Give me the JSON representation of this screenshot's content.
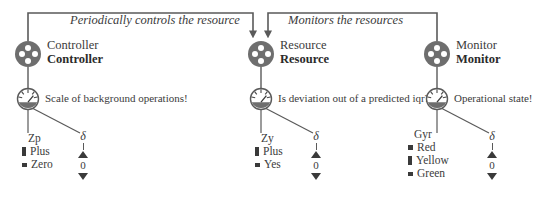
{
  "diagram": {
    "colors": {
      "node_fill": "#6e6e6e",
      "node_hole": "#ffffff",
      "wire": "#5a5a5a",
      "text": "#3b3b3b",
      "swatch": "#3a3a3a"
    }
  },
  "edges": [
    {
      "id": "controller-to-resource",
      "caption": "Periodically controls the resource",
      "from": "Controller",
      "to": "Resource"
    },
    {
      "id": "monitor-to-resource",
      "caption": "Monitors the resources",
      "from": "Monitor",
      "to": "Resource"
    }
  ],
  "columns": [
    {
      "id": "controller",
      "agent": {
        "icon": "pulley-wheel-icon",
        "name_plain": "Controller",
        "name_bold": "Controller"
      },
      "gauge": {
        "icon": "gauge-icon",
        "question": "Scale of background operations!"
      },
      "discrete_var": {
        "name": "Zp",
        "options": [
          {
            "label": "Plus",
            "level": "full"
          },
          {
            "label": "Zero",
            "level": "low"
          }
        ]
      },
      "continuous_var": {
        "symbol": "δ",
        "value": "0",
        "increase_icon": "triangle-up-icon",
        "decrease_icon": "triangle-down-icon"
      }
    },
    {
      "id": "resource",
      "agent": {
        "icon": "pulley-wheel-icon",
        "name_plain": "Resource",
        "name_bold": "Resource"
      },
      "gauge": {
        "icon": "gauge-icon",
        "question": "Is deviation out of a predicted iqr?"
      },
      "discrete_var": {
        "name": "Zy",
        "options": [
          {
            "label": "Plus",
            "level": "full"
          },
          {
            "label": "Yes",
            "level": "low"
          }
        ]
      },
      "continuous_var": {
        "symbol": "δ",
        "value": "0",
        "increase_icon": "triangle-up-icon",
        "decrease_icon": "triangle-down-icon"
      }
    },
    {
      "id": "monitor",
      "agent": {
        "icon": "pulley-wheel-icon",
        "name_plain": "Monitor",
        "name_bold": "Monitor"
      },
      "gauge": {
        "icon": "gauge-icon",
        "question": "Operational state!"
      },
      "discrete_var": {
        "name": "Gyr",
        "options": [
          {
            "label": "Red",
            "level": "mid"
          },
          {
            "label": "Yellow",
            "level": "full"
          },
          {
            "label": "Green",
            "level": "low"
          }
        ]
      },
      "continuous_var": {
        "symbol": "δ",
        "value": "0",
        "increase_icon": "triangle-up-icon",
        "decrease_icon": "triangle-down-icon"
      }
    }
  ]
}
